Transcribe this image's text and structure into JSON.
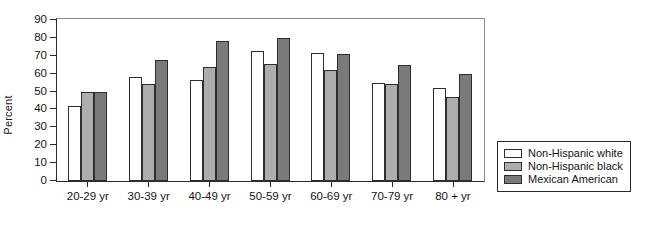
{
  "chart_data": {
    "type": "bar",
    "title": "",
    "xlabel": "",
    "ylabel": "Percent",
    "ylim": [
      0,
      90
    ],
    "yticks": [
      0,
      10,
      20,
      30,
      40,
      50,
      60,
      70,
      80,
      90
    ],
    "grid": false,
    "legend_position": "right-outside",
    "categories": [
      "20-29 yr",
      "30-39 yr",
      "40-49 yr",
      "50-59 yr",
      "60-69 yr",
      "70-79 yr",
      "80 + yr"
    ],
    "series": [
      {
        "name": "Non-Hispanic white",
        "color": "#ffffff",
        "values": [
          42,
          58,
          56.5,
          72.5,
          71.5,
          55,
          52
        ]
      },
      {
        "name": "Non-Hispanic black",
        "color": "#adadad",
        "values": [
          49.5,
          54,
          64,
          65.5,
          62,
          54.5,
          47
        ]
      },
      {
        "name": "Mexican American",
        "color": "#7a7a7a",
        "values": [
          49.5,
          67.5,
          78.5,
          80,
          71,
          65,
          60
        ]
      }
    ]
  },
  "axis": {
    "y_title": "Percent"
  },
  "legend": {
    "entries": [
      {
        "label": "Non-Hispanic white",
        "color": "#ffffff"
      },
      {
        "label": "Non-Hispanic black",
        "color": "#adadad"
      },
      {
        "label": "Mexican American",
        "color": "#7a7a7a"
      }
    ]
  }
}
